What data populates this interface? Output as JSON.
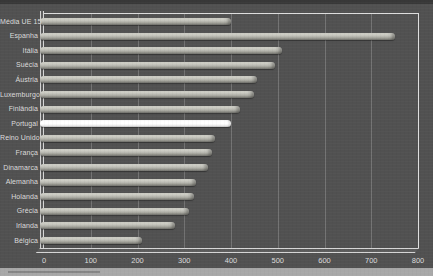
{
  "chart_data": {
    "type": "bar",
    "orientation": "horizontal",
    "categories": [
      "Média UE 15",
      "Espanha",
      "Itália",
      "Suécia",
      "Áustria",
      "Luxemburgo",
      "Finlândia",
      "Portugal",
      "Reino Unido",
      "França",
      "Dinamarca",
      "Alemanha",
      "Holanda",
      "Grécia",
      "Irlanda",
      "Bélgica"
    ],
    "values": [
      400,
      750,
      510,
      495,
      455,
      450,
      420,
      400,
      365,
      360,
      350,
      325,
      320,
      310,
      280,
      210
    ],
    "highlight_category": "Portugal",
    "xlim": [
      0,
      800
    ],
    "xticks": [
      0,
      100,
      200,
      300,
      400,
      500,
      600,
      700,
      800
    ],
    "grid": "vertical gridlines every 100",
    "legend": "none",
    "style": "3D-effect horizontal cylinder bars on dark scanned background",
    "colors": {
      "bar": "#b5b5ad",
      "bar_highlight": "#ffffff",
      "plot_background": "#515151",
      "page_background": "#a8a8a8",
      "axis_line": "#dedede",
      "gridline": "#737373",
      "label_text": "#dcdcdc"
    }
  }
}
